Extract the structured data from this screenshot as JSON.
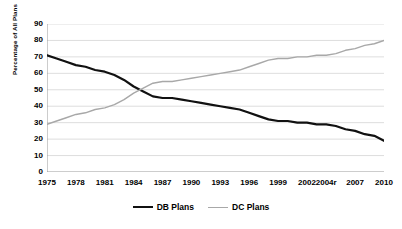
{
  "chart_data": {
    "type": "line",
    "title": "",
    "xlabel": "",
    "ylabel": "Percentage of All Plans",
    "ylim": [
      0,
      90
    ],
    "ytick_step": 10,
    "yticks": [
      0,
      10,
      20,
      30,
      40,
      50,
      60,
      70,
      80,
      90
    ],
    "ytick_labels": [
      "0",
      "10",
      "20",
      "30",
      "40",
      "50",
      "60",
      "70",
      "80",
      "90"
    ],
    "grid": true,
    "grid_axis": "y",
    "legend_position": "bottom",
    "xtick_labels": [
      "1975",
      "1978",
      "1981",
      "1984",
      "1987",
      "1990",
      "1993",
      "1996",
      "1999",
      "2002",
      "2004r",
      "2007",
      "2010"
    ],
    "x": [
      1975,
      1976,
      1977,
      1978,
      1979,
      1980,
      1981,
      1982,
      1983,
      1984,
      1985,
      1986,
      1987,
      1988,
      1989,
      1990,
      1991,
      1992,
      1993,
      1994,
      1995,
      1996,
      1997,
      1998,
      1999,
      2000,
      2001,
      2002,
      2003,
      2004,
      2005,
      2006,
      2007,
      2008,
      2009,
      2010
    ],
    "xlim": [
      1975,
      2010
    ],
    "series": [
      {
        "name": "DB Plans",
        "color": "#111111",
        "line_width": 2.2,
        "values": [
          71,
          69,
          67,
          65,
          64,
          62,
          61,
          59,
          56,
          52,
          49,
          46,
          45,
          45,
          44,
          43,
          42,
          41,
          40,
          39,
          38,
          36,
          34,
          32,
          31,
          31,
          30,
          30,
          29,
          29,
          28,
          26,
          25,
          23,
          22,
          19
        ]
      },
      {
        "name": "DC Plans",
        "color": "#a8a8a8",
        "line_width": 1.4,
        "values": [
          29,
          31,
          33,
          35,
          36,
          38,
          39,
          41,
          44,
          48,
          51,
          54,
          55,
          55,
          56,
          57,
          58,
          59,
          60,
          61,
          62,
          64,
          66,
          68,
          69,
          69,
          70,
          70,
          71,
          71,
          72,
          74,
          75,
          77,
          78,
          80
        ]
      }
    ]
  },
  "legend": {
    "entries": [
      {
        "label": "DB Plans"
      },
      {
        "label": "DC Plans"
      }
    ]
  },
  "axes": {
    "y_title": "Percentage of All Plans"
  }
}
